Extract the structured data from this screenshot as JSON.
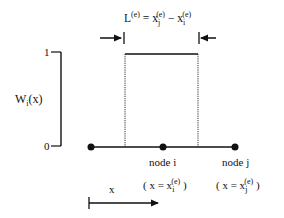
{
  "diagram": {
    "type": "finite-element shape function (top-hat)",
    "length_label": {
      "main": "L",
      "sup": "(e)",
      "eq": " = x",
      "xj_sub": "j",
      "xj_sup": "(e)",
      "minus": " − x",
      "xi_sub": "i",
      "xi_sup": "(e)"
    },
    "y_axis": {
      "label_main": "W",
      "label_sub": "i",
      "label_arg": "(x)",
      "tick_top": "1",
      "tick_bottom": "0"
    },
    "nodes": [
      {
        "label": "",
        "pos_label": ""
      },
      {
        "label": "node i",
        "pos_open": "( x = x",
        "pos_sub": "i",
        "pos_sup": "(e)",
        "pos_close": " )"
      },
      {
        "label": "node j",
        "pos_open": "( x = x",
        "pos_sub": "j",
        "pos_sup": "(e)",
        "pos_close": " )"
      }
    ],
    "x_arrow_label": "x",
    "colors": {
      "line": "#111111",
      "background": "#ffffff"
    }
  }
}
